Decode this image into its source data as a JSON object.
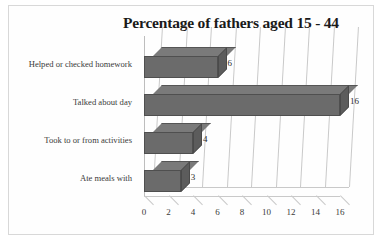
{
  "chart_data": {
    "type": "bar",
    "orientation": "horizontal",
    "title": "Percentage of fathers aged 15 - 44",
    "xlabel": "",
    "ylabel": "",
    "categories": [
      "Helped or checked homework",
      "Talked about day",
      "Took to or from activities",
      "Ate meals with"
    ],
    "values": [
      6,
      16,
      4,
      3
    ],
    "data_labels": [
      "6",
      "16",
      "4",
      "3"
    ],
    "xticks": [
      0,
      2,
      4,
      6,
      8,
      10,
      12,
      14,
      16
    ],
    "xtick_labels": [
      "0",
      "2",
      "4",
      "6",
      "8",
      "10",
      "12",
      "14",
      "16"
    ],
    "xlim": [
      0,
      16
    ],
    "grid": true,
    "grid_axis": "x",
    "legend": false,
    "style_3d": true,
    "bar_color": "#6b6b6b",
    "grid_color": "#c9c9c9",
    "border_color": "#d8d8d8",
    "background": "#ffffff"
  }
}
